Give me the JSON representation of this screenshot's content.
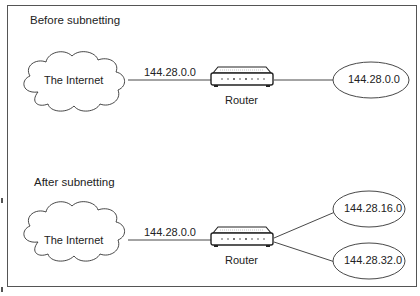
{
  "sections": [
    {
      "title": "Before subnetting",
      "cloud_label": "The Internet",
      "link_label": "144.28.0.0",
      "router_label": "Router",
      "networks": [
        "144.28.0.0"
      ]
    },
    {
      "title": "After subnetting",
      "cloud_label": "The Internet",
      "link_label": "144.28.0.0",
      "router_label": "Router",
      "networks": [
        "144.28.16.0",
        "144.28.32.0"
      ]
    }
  ]
}
